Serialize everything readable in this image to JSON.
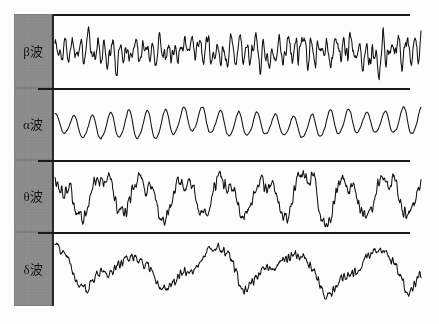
{
  "figure": {
    "background": "#ffffff",
    "trace_color": "#111111",
    "label_box_color": "#8d8d8d",
    "frame_color": "#1a1a1a"
  },
  "bands": [
    {
      "id": "beta",
      "label": "β波",
      "greek": "β",
      "descriptor": "high frequency, low amplitude",
      "top": 14,
      "height": 74,
      "wave": {
        "base_freq": 46,
        "amplitude": 12,
        "roughness": 0.85,
        "seed": 11,
        "harmonics": [
          {
            "freq": 46,
            "amp": 9,
            "phase": 0.3
          },
          {
            "freq": 67,
            "amp": 5,
            "phase": 1.9
          },
          {
            "freq": 31,
            "amp": 4,
            "phase": 2.6
          },
          {
            "freq": 88,
            "amp": 2.5,
            "phase": 0.8
          },
          {
            "freq": 7,
            "amp": 3,
            "phase": 4.1
          },
          {
            "freq": 3,
            "amp": 2,
            "phase": 1.2
          }
        ]
      }
    },
    {
      "id": "alpha",
      "label": "α波",
      "greek": "α",
      "descriptor": "smooth regular sinusoid",
      "top": 88,
      "height": 72,
      "wave": {
        "base_freq": 20,
        "amplitude": 16,
        "roughness": 0.06,
        "seed": 27,
        "harmonics": [
          {
            "freq": 20,
            "amp": 13,
            "phase": 1.4
          },
          {
            "freq": 40,
            "amp": 1.6,
            "phase": 0.5
          },
          {
            "freq": 2,
            "amp": 3,
            "phase": 3.0
          },
          {
            "freq": 5,
            "amp": 1.8,
            "phase": 2.2
          }
        ]
      }
    },
    {
      "id": "theta",
      "label": "θ波",
      "greek": "θ",
      "descriptor": "slow jagged oscillation",
      "top": 160,
      "height": 72,
      "wave": {
        "base_freq": 9,
        "amplitude": 24,
        "roughness": 0.34,
        "seed": 43,
        "harmonics": [
          {
            "freq": 9,
            "amp": 19,
            "phase": 0.6
          },
          {
            "freq": 18,
            "amp": 6,
            "phase": 2.4
          },
          {
            "freq": 27,
            "amp": 3.2,
            "phase": 1.1
          },
          {
            "freq": 4,
            "amp": 4,
            "phase": 3.6
          },
          {
            "freq": 36,
            "amp": 1.8,
            "phase": 5.0
          }
        ]
      }
    },
    {
      "id": "delta",
      "label": "δ波",
      "greek": "δ",
      "descriptor": "slowest, broad high-amplitude waves",
      "top": 232,
      "height": 74,
      "wave": {
        "base_freq": 4.5,
        "amplitude": 22,
        "roughness": 0.26,
        "seed": 61,
        "harmonics": [
          {
            "freq": 4.5,
            "amp": 18,
            "phase": 2.1
          },
          {
            "freq": 9,
            "amp": 5.5,
            "phase": 0.9
          },
          {
            "freq": 13.5,
            "amp": 2.6,
            "phase": 4.4
          },
          {
            "freq": 2,
            "amp": 4.5,
            "phase": 1.7
          },
          {
            "freq": 22,
            "amp": 1.4,
            "phase": 3.3
          }
        ]
      }
    }
  ],
  "chart_data": {
    "type": "line",
    "xlabel": "",
    "ylabel": "",
    "grid": false,
    "legend": "left column labels",
    "series": [
      {
        "name": "β波",
        "frequency_hz_range": "13-30",
        "relative_amplitude": 0.35,
        "character": "fast, low amplitude, irregular"
      },
      {
        "name": "α波",
        "frequency_hz_range": "8-13",
        "relative_amplitude": 0.5,
        "character": "regular, smooth sinusoidal"
      },
      {
        "name": "θ波",
        "frequency_hz_range": "4-8",
        "relative_amplitude": 0.8,
        "character": "slow, large, jagged"
      },
      {
        "name": "δ波",
        "frequency_hz_range": "0.5-4",
        "relative_amplitude": 0.85,
        "character": "slowest, broad rolling waves"
      }
    ]
  }
}
